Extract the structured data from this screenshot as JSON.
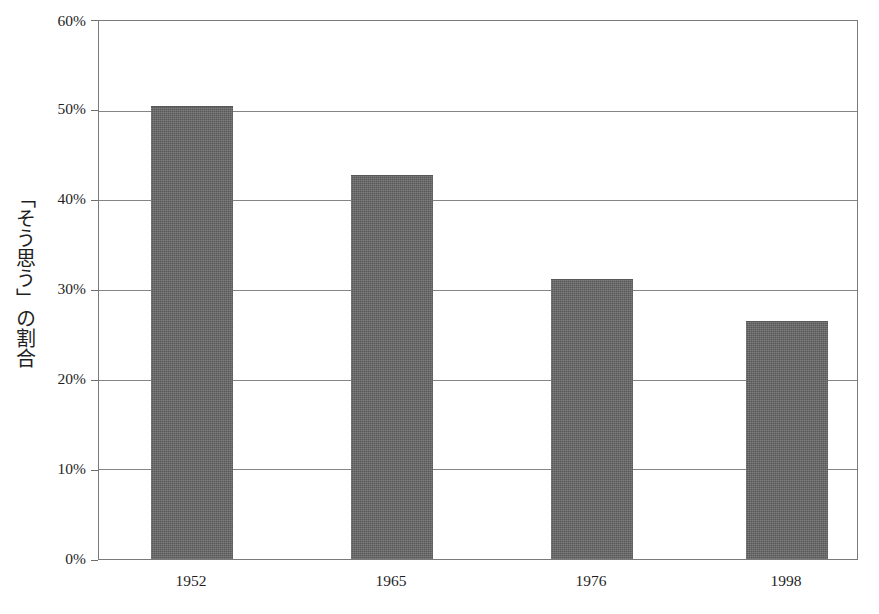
{
  "chart_data": {
    "type": "bar",
    "title": "",
    "subtitle": "",
    "xlabel": "",
    "ylabel": "「そう思う」の割合",
    "categories": [
      "1952",
      "1965",
      "1976",
      "1998"
    ],
    "values": [
      50.5,
      42.8,
      31.2,
      26.5
    ],
    "series": [
      {
        "name": "「そう思う」の割合",
        "values": [
          50.5,
          42.8,
          31.2,
          26.5
        ]
      }
    ],
    "ylim": [
      0,
      60
    ],
    "yticks": [
      0,
      10,
      20,
      30,
      40,
      50,
      60
    ],
    "ytick_labels": [
      "0%",
      "10%",
      "20%",
      "30%",
      "40%",
      "50%",
      "60%"
    ],
    "grid": true,
    "grid_axis": "y",
    "legend": false,
    "legend_position": "none",
    "bar_color": "#636363",
    "grid_color": "#858585",
    "axis_color": "#7a7a7a",
    "background_color": "#ffffff",
    "units": "percent"
  },
  "axes": {
    "y_title": "「そう思う」の割合",
    "y_ticks": [
      {
        "label": "60%",
        "value": 60
      },
      {
        "label": "50%",
        "value": 50
      },
      {
        "label": "40%",
        "value": 40
      },
      {
        "label": "30%",
        "value": 30
      },
      {
        "label": "20%",
        "value": 20
      },
      {
        "label": "10%",
        "value": 10
      },
      {
        "label": "0%",
        "value": 0
      }
    ],
    "x_ticks": [
      {
        "label": "1952"
      },
      {
        "label": "1965"
      },
      {
        "label": "1976"
      },
      {
        "label": "1998"
      }
    ]
  },
  "bars": [
    {
      "category": "1952",
      "value": 50.5,
      "label": "1952"
    },
    {
      "category": "1965",
      "value": 42.8,
      "label": "1965"
    },
    {
      "category": "1976",
      "value": 31.2,
      "label": "1976"
    },
    {
      "category": "1998",
      "value": 26.5,
      "label": "1998"
    }
  ],
  "caption": {
    "text": ""
  }
}
